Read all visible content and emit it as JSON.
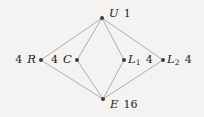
{
  "figure": {
    "kind": "lattice-diagram",
    "width": 204,
    "height": 117,
    "background_color": "#f4f3f1",
    "edge_color": "#9a9a9a",
    "node_color": "#3c3c3c",
    "text_color": "#1d1d1d"
  },
  "nodes": [
    {
      "id": "U",
      "symbol": "U",
      "value": "1",
      "label_text": "U 1",
      "x": 102,
      "y": 18,
      "label_x": 109,
      "label_y": 14,
      "label_align": "right"
    },
    {
      "id": "R",
      "symbol": "R",
      "value": "4",
      "label_text": "4 R",
      "x": 41,
      "y": 60,
      "label_x": 36,
      "label_y": 60,
      "label_align": "left"
    },
    {
      "id": "C",
      "symbol": "C",
      "value": "4",
      "label_text": "4 C",
      "x": 77,
      "y": 60,
      "label_x": 72,
      "label_y": 60,
      "label_align": "left"
    },
    {
      "id": "L1",
      "symbol": "L",
      "subscript": "1",
      "value": "4",
      "label_text": "L1 4",
      "x": 124,
      "y": 60,
      "label_x": 128,
      "label_y": 60,
      "label_align": "right"
    },
    {
      "id": "L2",
      "symbol": "L",
      "subscript": "2",
      "value": "4",
      "label_text": "L2 4",
      "x": 163,
      "y": 60,
      "label_x": 167,
      "label_y": 60,
      "label_align": "right"
    },
    {
      "id": "E",
      "symbol": "E",
      "value": "16",
      "label_text": "E 16",
      "x": 103,
      "y": 99,
      "label_x": 110,
      "label_y": 105,
      "label_align": "right"
    }
  ],
  "edges": [
    {
      "from": "U",
      "to": "R"
    },
    {
      "from": "U",
      "to": "C"
    },
    {
      "from": "U",
      "to": "L1"
    },
    {
      "from": "U",
      "to": "L2"
    },
    {
      "from": "R",
      "to": "E"
    },
    {
      "from": "C",
      "to": "E"
    },
    {
      "from": "L1",
      "to": "E"
    },
    {
      "from": "L2",
      "to": "E"
    }
  ]
}
